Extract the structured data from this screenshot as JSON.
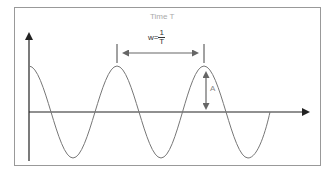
{
  "diagram": {
    "title": "Time T",
    "frequency_label_prefix": "w=",
    "frequency_numerator": "1",
    "frequency_denominator": "T",
    "amplitude_label": "A",
    "colors": {
      "frame": "#999999",
      "axis": "#222222",
      "wave": "#777777",
      "title": "#aaaaaa",
      "arrow": "#666666"
    }
  }
}
